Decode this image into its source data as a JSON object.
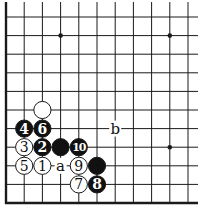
{
  "diagram": {
    "type": "go-board-corner",
    "grid": {
      "cols": 11,
      "rows": 11,
      "x0": 6,
      "y0": 17,
      "dx": 18.2,
      "dy": 18.6
    },
    "edges": {
      "left": true,
      "bottom": true,
      "top": false,
      "right": false
    },
    "colors": {
      "line": "#1a1a1a",
      "black_stone": "#111111",
      "white_stone": "#ffffff",
      "text_on_black": "#ffffff",
      "text_on_white": "#111111"
    },
    "star_points": [
      [
        3,
        1
      ],
      [
        9,
        1
      ],
      [
        9,
        7
      ]
    ],
    "stones": [
      {
        "col": 2,
        "row": 5,
        "color": "white",
        "label": ""
      },
      {
        "col": 1,
        "row": 6,
        "color": "black",
        "label": "4"
      },
      {
        "col": 2,
        "row": 6,
        "color": "black",
        "label": "6"
      },
      {
        "col": 1,
        "row": 7,
        "color": "white",
        "label": "3"
      },
      {
        "col": 2,
        "row": 7,
        "color": "black",
        "label": "2"
      },
      {
        "col": 3,
        "row": 7,
        "color": "black",
        "label": ""
      },
      {
        "col": 4,
        "row": 7,
        "color": "black",
        "label": "10"
      },
      {
        "col": 1,
        "row": 8,
        "color": "white",
        "label": "5"
      },
      {
        "col": 2,
        "row": 8,
        "color": "white",
        "label": "1"
      },
      {
        "col": 4,
        "row": 8,
        "color": "white",
        "label": "9"
      },
      {
        "col": 5,
        "row": 8,
        "color": "black",
        "label": ""
      },
      {
        "col": 4,
        "row": 9,
        "color": "white",
        "label": "7"
      },
      {
        "col": 5,
        "row": 9,
        "color": "black",
        "label": "8"
      }
    ],
    "markers": [
      {
        "col": 3,
        "row": 8,
        "text": "a"
      },
      {
        "col": 6,
        "row": 6,
        "text": "b"
      }
    ]
  }
}
